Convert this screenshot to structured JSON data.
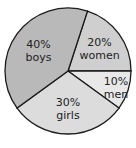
{
  "chart_data": {
    "type": "pie",
    "title": "",
    "slices": [
      {
        "label": "women",
        "value": 20,
        "pct_text": "20%",
        "color": "#cfcfcf"
      },
      {
        "label": "men",
        "value": 10,
        "pct_text": "10%",
        "color": "#e8e8e8"
      },
      {
        "label": "girls",
        "value": 30,
        "pct_text": "30%",
        "color": "#dcdcdc"
      },
      {
        "label": "boys",
        "value": 40,
        "pct_text": "40%",
        "color": "#b9b9b9"
      }
    ],
    "legend": "none",
    "labels_inside": true
  }
}
